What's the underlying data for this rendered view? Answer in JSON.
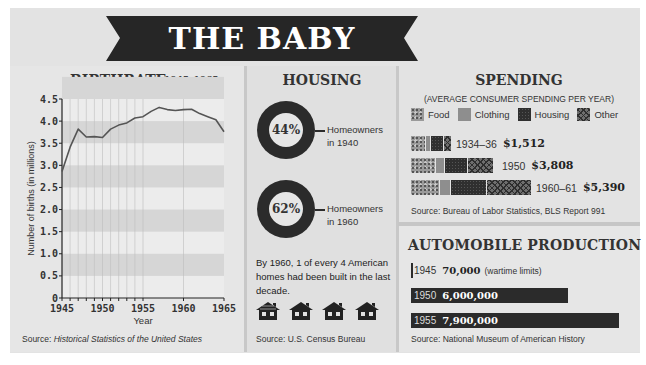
{
  "title": "THE BABY BOOM",
  "birthrate": {
    "title": "BIRTHRATE",
    "range_label": "1945–1965",
    "ylabel": "Number of births (in millions)",
    "xlabel": "Year",
    "source_prefix": "Source: ",
    "source": "Historical Statistics of the United States"
  },
  "housing": {
    "title": "HOUSING",
    "items": [
      {
        "pct": "44%",
        "value": 44,
        "label_line1": "Homeowners",
        "label_line2": "in 1940"
      },
      {
        "pct": "62%",
        "value": 62,
        "label_line1": "Homeowners",
        "label_line2": "in 1960"
      }
    ],
    "note": "By 1960, 1 of every 4 American homes had been built in the last decade.",
    "house_icon_count": 4,
    "source": "Source: U.S. Census Bureau"
  },
  "spending": {
    "title": "SPENDING",
    "subtitle": "(AVERAGE CONSUMER SPENDING PER YEAR)",
    "legend": [
      {
        "label": "Food",
        "pattern": "food"
      },
      {
        "label": "Clothing",
        "pattern": "clothing"
      },
      {
        "label": "Housing",
        "pattern": "housing"
      },
      {
        "label": "Other",
        "pattern": "other"
      }
    ],
    "rows": [
      {
        "year": "1934–36",
        "amount": "$1,512",
        "segments_px": [
          14,
          4,
          12,
          7
        ]
      },
      {
        "year": "1950",
        "amount": "$3,808",
        "segments_px": [
          24,
          8,
          22,
          25
        ]
      },
      {
        "year": "1960–61",
        "amount": "$5,390",
        "segments_px": [
          28,
          10,
          35,
          44
        ]
      }
    ],
    "source": "Source:  Bureau of Labor Statistics, BLS Report 991"
  },
  "automobile": {
    "title": "AUTOMOBILE PRODUCTION",
    "rows": [
      {
        "year": "1945",
        "value": "70,000",
        "note": "(wartime limits)",
        "bar_px": 2
      },
      {
        "year": "1950",
        "value": "6,000,000",
        "note": "",
        "bar_px": 157
      },
      {
        "year": "1955",
        "value": "7,900,000",
        "note": "",
        "bar_px": 208
      }
    ],
    "source": "Source: National Museum of American History"
  },
  "chart_data": [
    {
      "type": "line",
      "title": "BIRTHRATE 1945–1965",
      "xlabel": "Year",
      "ylabel": "Number of births (in millions)",
      "x": [
        1945,
        1946,
        1947,
        1948,
        1949,
        1950,
        1951,
        1952,
        1953,
        1954,
        1955,
        1956,
        1957,
        1958,
        1959,
        1960,
        1961,
        1962,
        1963,
        1964,
        1965
      ],
      "series": [
        {
          "name": "Births (millions)",
          "values": [
            2.86,
            3.41,
            3.82,
            3.64,
            3.65,
            3.63,
            3.82,
            3.91,
            3.96,
            4.07,
            4.1,
            4.22,
            4.31,
            4.26,
            4.24,
            4.26,
            4.27,
            4.17,
            4.1,
            4.03,
            3.76
          ]
        }
      ],
      "xticks": [
        "1945",
        "1950",
        "1955",
        "1960",
        "1965"
      ],
      "yticks": [
        "0",
        "0.5",
        "1.0",
        "1.5",
        "2.0",
        "2.5",
        "3.0",
        "3.5",
        "4.0",
        "4.5"
      ],
      "xlim": [
        1945,
        1965
      ],
      "ylim": [
        0,
        4.5
      ],
      "grid": true,
      "source": "Source: Historical Statistics of the United States"
    },
    {
      "type": "pie",
      "title": "HOUSING",
      "categories": [
        "Homeowners in 1940",
        "Homeowners in 1960"
      ],
      "values": [
        44,
        62
      ],
      "unit": "%"
    },
    {
      "type": "bar",
      "title": "SPENDING (AVERAGE CONSUMER SPENDING PER YEAR)",
      "categories": [
        "1934–36",
        "1950",
        "1960–61"
      ],
      "values": [
        1512,
        3808,
        5390
      ],
      "legend": [
        "Food",
        "Clothing",
        "Housing",
        "Other"
      ],
      "source": "Source: Bureau of Labor Statistics, BLS Report 991"
    },
    {
      "type": "bar",
      "title": "AUTOMOBILE PRODUCTION",
      "categories": [
        "1945",
        "1950",
        "1955"
      ],
      "values": [
        70000,
        6000000,
        7900000
      ],
      "annotations": [
        "(wartime limits)"
      ],
      "source": "Source: National Museum of American History"
    }
  ]
}
